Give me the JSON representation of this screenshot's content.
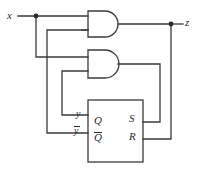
{
  "figure": {
    "type": "logic-circuit-diagram",
    "stroke_color": "#3a3a3a",
    "background_color": "#ffffff",
    "width": 201,
    "height": 170
  },
  "labels": {
    "input_x": "x",
    "output_z": "z",
    "feedback_y": "y",
    "feedback_y_bar": "y",
    "ff_q": "Q",
    "ff_q_bar": "Q",
    "ff_s": "S",
    "ff_r": "R"
  },
  "components": [
    {
      "name": "and-gate-top",
      "type": "AND",
      "inputs": [
        "x",
        "y-bar"
      ],
      "output": "z"
    },
    {
      "name": "and-gate-bottom",
      "type": "AND",
      "inputs": [
        "x",
        "y"
      ],
      "output": "S"
    },
    {
      "name": "sr-flip-flop",
      "type": "SR-latch",
      "inputs": [
        "S",
        "R"
      ],
      "outputs": [
        "Q",
        "Q-bar"
      ]
    }
  ],
  "nets": [
    {
      "name": "x-fanout",
      "from": "x",
      "to": [
        "and-gate-top.in1",
        "and-gate-bottom.in1"
      ]
    },
    {
      "name": "z-net",
      "from": "and-gate-top.out",
      "to": [
        "z",
        "sr-flip-flop.R"
      ]
    },
    {
      "name": "s-net",
      "from": "and-gate-bottom.out",
      "to": [
        "sr-flip-flop.S"
      ]
    },
    {
      "name": "y-feedback",
      "from": "sr-flip-flop.Q",
      "to": [
        "and-gate-bottom.in2"
      ]
    },
    {
      "name": "ybar-feedback",
      "from": "sr-flip-flop.Q-bar",
      "to": [
        "and-gate-top.in2"
      ]
    }
  ]
}
